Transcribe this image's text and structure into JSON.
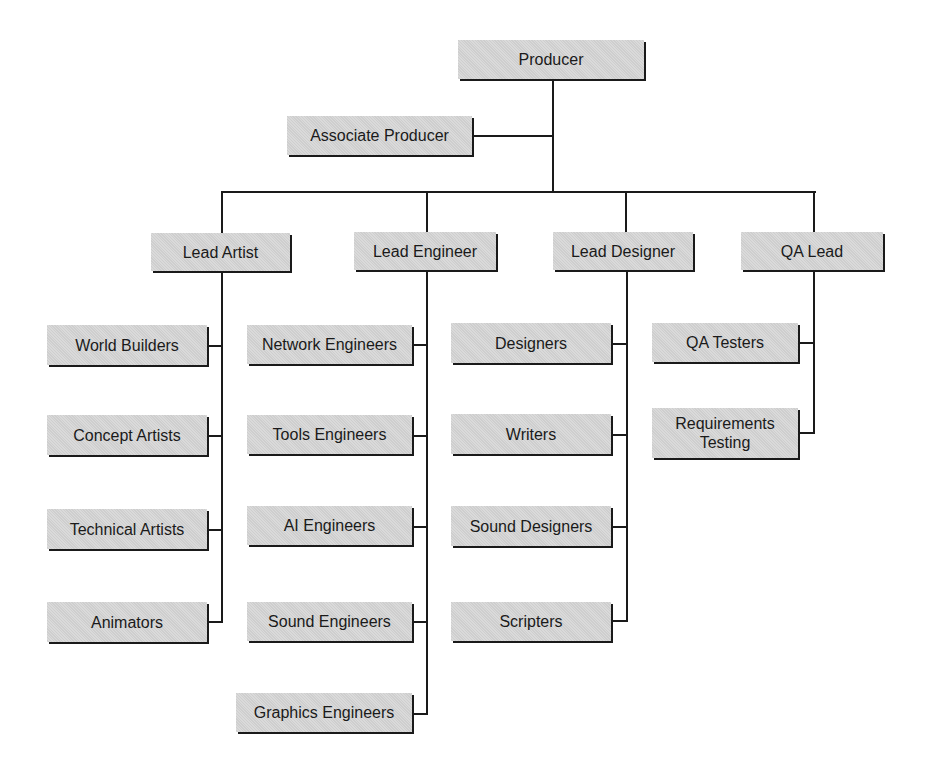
{
  "diagram": {
    "type": "org-chart",
    "colors": {
      "box_fill": "#d6d6d6",
      "line": "#1a1a1a",
      "background": "#ffffff"
    },
    "root": {
      "id": "producer",
      "label": "Producer"
    },
    "assistant": {
      "id": "associate-producer",
      "label": "Associate Producer",
      "reports_to": "producer"
    },
    "leads": [
      {
        "id": "lead-artist",
        "label": "Lead Artist",
        "reports_to": "producer",
        "team": [
          {
            "id": "world-builders",
            "label": "World Builders"
          },
          {
            "id": "concept-artists",
            "label": "Concept Artists"
          },
          {
            "id": "technical-artists",
            "label": "Technical Artists"
          },
          {
            "id": "animators",
            "label": "Animators"
          }
        ]
      },
      {
        "id": "lead-engineer",
        "label": "Lead Engineer",
        "reports_to": "producer",
        "team": [
          {
            "id": "network-engineers",
            "label": "Network Engineers"
          },
          {
            "id": "tools-engineers",
            "label": "Tools Engineers"
          },
          {
            "id": "ai-engineers",
            "label": "AI Engineers"
          },
          {
            "id": "sound-engineers",
            "label": "Sound Engineers"
          },
          {
            "id": "graphics-engineers",
            "label": "Graphics Engineers"
          }
        ]
      },
      {
        "id": "lead-designer",
        "label": "Lead Designer",
        "reports_to": "producer",
        "team": [
          {
            "id": "designers",
            "label": "Designers"
          },
          {
            "id": "writers",
            "label": "Writers"
          },
          {
            "id": "sound-designers",
            "label": "Sound Designers"
          },
          {
            "id": "scripters",
            "label": "Scripters"
          }
        ]
      },
      {
        "id": "qa-lead",
        "label": "QA Lead",
        "reports_to": "producer",
        "team": [
          {
            "id": "qa-testers",
            "label": "QA Testers"
          },
          {
            "id": "requirements-testing",
            "label": "Requirements\nTesting"
          }
        ]
      }
    ]
  }
}
